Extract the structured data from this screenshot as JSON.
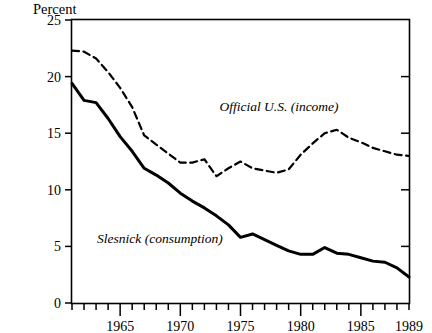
{
  "chart_data": {
    "type": "line",
    "title": "",
    "subtitle": "",
    "unit_label": "Percent",
    "xlabel": "",
    "ylabel": "",
    "xlim": [
      1961,
      1989
    ],
    "ylim": [
      0,
      25
    ],
    "yticks": [
      0,
      5,
      10,
      15,
      20,
      25
    ],
    "ytick_labels": [
      "0",
      "5",
      "10",
      "15",
      "20",
      "25"
    ],
    "xticks": [
      1965,
      1970,
      1975,
      1980,
      1985,
      1989
    ],
    "xtick_labels": [
      "1965",
      "1970",
      "1975",
      "1980",
      "1985",
      "1989"
    ],
    "minor_xticks_every": 1,
    "grid": false,
    "legend_position": "inline-annotations",
    "x": [
      1961,
      1962,
      1963,
      1964,
      1965,
      1966,
      1967,
      1968,
      1969,
      1970,
      1971,
      1972,
      1973,
      1974,
      1975,
      1976,
      1977,
      1978,
      1979,
      1980,
      1981,
      1982,
      1983,
      1984,
      1985,
      1986,
      1987,
      1988,
      1989
    ],
    "series": [
      {
        "name": "Official U.S. (income)",
        "style": "dashed",
        "label_text": "Official U.S. (income)",
        "values": [
          22.3,
          22.2,
          21.6,
          20.4,
          19.0,
          17.3,
          14.8,
          14.0,
          13.2,
          12.4,
          12.4,
          12.7,
          11.2,
          11.9,
          12.5,
          11.9,
          11.7,
          11.5,
          11.8,
          13.1,
          14.1,
          15.0,
          15.3,
          14.6,
          14.2,
          13.7,
          13.4,
          13.1,
          13.0
        ]
      },
      {
        "name": "Slesnick (consumption)",
        "style": "solid",
        "label_text": "Slesnick (consumption)",
        "values": [
          19.4,
          17.9,
          17.7,
          16.3,
          14.7,
          13.4,
          11.9,
          11.3,
          10.6,
          9.7,
          9.0,
          8.4,
          7.7,
          6.9,
          5.8,
          6.1,
          5.6,
          5.1,
          4.6,
          4.3,
          4.3,
          4.9,
          4.4,
          4.3,
          4.0,
          3.7,
          3.6,
          3.1,
          2.3
        ]
      }
    ],
    "annotations": [
      {
        "text": "Official U.S. (income)",
        "x": 1978.2,
        "y": 17.0,
        "data_name": "series-label-official-us"
      },
      {
        "text": "Slesnick (consumption)",
        "x": 1968.3,
        "y": 5.3,
        "data_name": "series-label-slesnick"
      }
    ]
  }
}
